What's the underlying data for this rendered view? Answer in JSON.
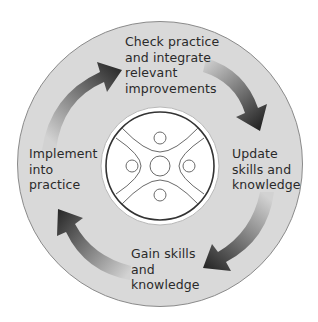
{
  "diagram": {
    "type": "cycle",
    "colors": {
      "background": "#ffffff",
      "outer_disc": "#d9d9d9",
      "outer_disc_stroke": "#8a8a8a",
      "arrow_light": "#cfcfcf",
      "arrow_dark": "#2b2b2b",
      "emblem_fill": "#ffffff",
      "emblem_ring": "#3a3a3a",
      "emblem_lines": "#6a6a6a",
      "text": "#2a2a2a"
    },
    "steps": [
      {
        "id": "check",
        "position": "top",
        "lines": [
          "Check practice",
          "and integrate",
          "relevant",
          "improvements"
        ]
      },
      {
        "id": "update",
        "position": "right",
        "lines": [
          "Update",
          "skills and",
          "knowledge"
        ]
      },
      {
        "id": "gain",
        "position": "bottom",
        "lines": [
          "Gain skills",
          "and",
          "knowledge"
        ]
      },
      {
        "id": "implement",
        "position": "left",
        "lines": [
          "Implement",
          "into",
          "practice"
        ]
      }
    ],
    "arrows": [
      {
        "from": "implement",
        "to": "check",
        "direction": "clockwise"
      },
      {
        "from": "check",
        "to": "update",
        "direction": "clockwise"
      },
      {
        "from": "update",
        "to": "gain",
        "direction": "clockwise"
      },
      {
        "from": "gain",
        "to": "implement",
        "direction": "clockwise"
      }
    ],
    "center_emblem": {
      "icon": "four-quadrant-emblem-icon"
    }
  }
}
